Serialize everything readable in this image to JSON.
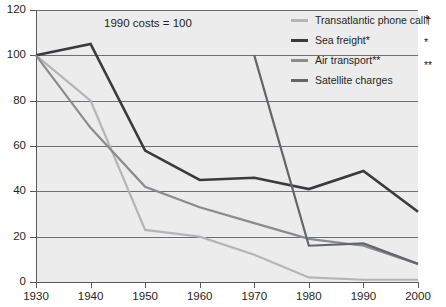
{
  "chart_data": {
    "type": "line",
    "title": "1990 costs = 100",
    "xlabel": "",
    "ylabel": "",
    "x": [
      1930,
      1940,
      1950,
      1960,
      1970,
      1980,
      1990,
      2000
    ],
    "xlim": [
      1930,
      2000
    ],
    "ylim": [
      0,
      120
    ],
    "ytick_labels": [
      "0",
      "20",
      "40",
      "60",
      "80",
      "100",
      "120"
    ],
    "ytick_values": [
      0,
      20,
      40,
      60,
      80,
      100,
      120
    ],
    "xtick_labels": [
      "1930",
      "1940",
      "1950",
      "1960",
      "1970",
      "1980",
      "1990",
      "2000"
    ],
    "grid": "horizontal",
    "legend_position": "top-right",
    "series": [
      {
        "name": "Transatlantic phone call†",
        "color": "#b4b5b7",
        "x": [
          1930,
          1940,
          1950,
          1960,
          1970,
          1980,
          1990,
          2000
        ],
        "values": [
          100,
          80,
          23,
          20,
          12,
          2,
          1,
          1
        ]
      },
      {
        "name": "Sea freight*",
        "color": "#3b3b3d",
        "x": [
          1930,
          1940,
          1950,
          1960,
          1970,
          1980,
          1990,
          2000
        ],
        "values": [
          100,
          105,
          58,
          45,
          46,
          41,
          49,
          31
        ]
      },
      {
        "name": "Air transport**",
        "color": "#8a8b8d",
        "x": [
          1930,
          1940,
          1950,
          1960,
          1970,
          1980,
          1990,
          2000
        ],
        "values": [
          100,
          68,
          42,
          33,
          26,
          19,
          16,
          8
        ]
      },
      {
        "name": "Satellite charges",
        "color": "#646568",
        "x": [
          1970,
          1980,
          1990,
          2000
        ],
        "values": [
          100,
          16,
          17,
          8
        ]
      }
    ]
  },
  "legend": {
    "items": [
      {
        "label": "Transatlantic phone call†",
        "swatch": "#b4b5b7"
      },
      {
        "label": "Sea freight*",
        "swatch": "#3b3b3d"
      },
      {
        "label": "Air transport**",
        "swatch": "#8a8b8d"
      },
      {
        "label": "Satellite charges",
        "swatch": "#646568"
      }
    ]
  },
  "footnotes": {
    "marks": [
      "†",
      "*",
      "**"
    ]
  },
  "colors": {
    "plot_background": "#ececed",
    "gridline": "#6e6f72",
    "axis": "#58585a",
    "text": "#231f20"
  }
}
